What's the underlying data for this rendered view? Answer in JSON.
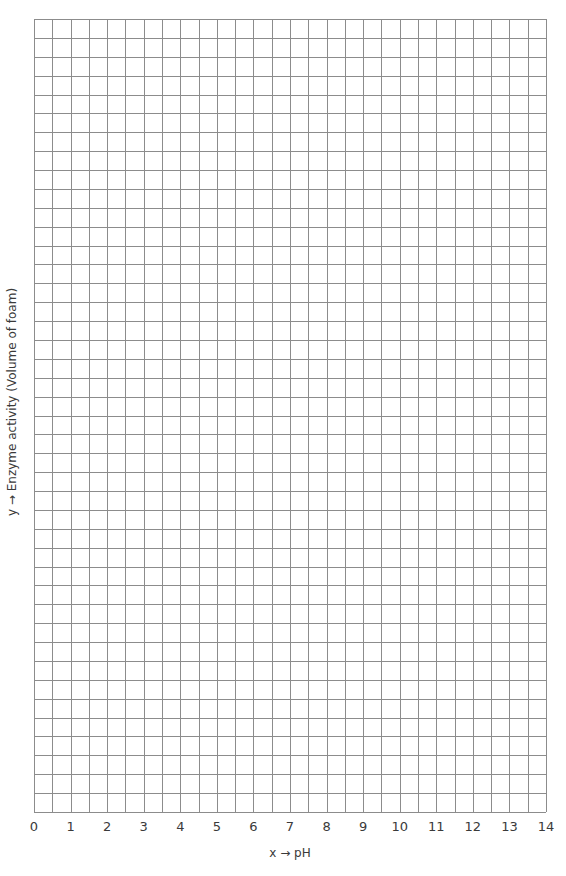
{
  "chart_data": {
    "type": "line",
    "title": "",
    "xlabel": "x → pH",
    "ylabel": "y → Enzyme activity (Volume of foam)",
    "x_ticks": [
      "0",
      "1",
      "2",
      "3",
      "4",
      "5",
      "6",
      "7",
      "8",
      "9",
      "10",
      "11",
      "12",
      "13",
      "14"
    ],
    "xlim": [
      0,
      14
    ],
    "y_ticks": [],
    "grid": true,
    "grid_columns": 28,
    "grid_rows": 42,
    "series": [],
    "legend": null,
    "note": "Blank graph-paper grid for plotting enzyme activity vs pH; no data points plotted"
  },
  "style": {
    "grid_color": "#8c8c8c",
    "text_color": "#3a3a3a",
    "background": "#ffffff"
  },
  "layout": {
    "plot_left": 34,
    "plot_top": 19,
    "plot_right": 546,
    "plot_bottom": 812
  }
}
